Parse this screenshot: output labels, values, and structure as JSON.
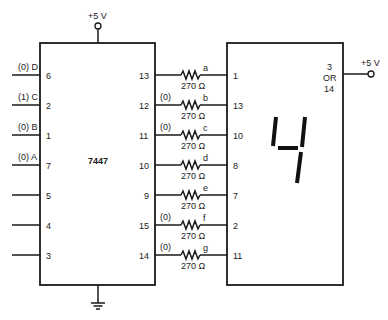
{
  "decoder": {
    "label": "7447",
    "vcc_label": "+5 V",
    "inputs": [
      {
        "name": "(0) D",
        "pin": "6"
      },
      {
        "name": "(1) C",
        "pin": "2"
      },
      {
        "name": "(0) B",
        "pin": "1"
      },
      {
        "name": "(0) A",
        "pin": "7"
      },
      {
        "name": "",
        "pin": "5"
      },
      {
        "name": "",
        "pin": "4"
      },
      {
        "name": "",
        "pin": "3"
      }
    ],
    "outputs": [
      {
        "pin": "13",
        "state": "",
        "segment": "a",
        "resistor": "270 Ω",
        "display_pin": "1"
      },
      {
        "pin": "12",
        "state": "(0)",
        "segment": "b",
        "resistor": "270 Ω",
        "display_pin": "13"
      },
      {
        "pin": "11",
        "state": "(0)",
        "segment": "c",
        "resistor": "270 Ω",
        "display_pin": "10"
      },
      {
        "pin": "10",
        "state": "",
        "segment": "d",
        "resistor": "270 Ω",
        "display_pin": "8"
      },
      {
        "pin": "9",
        "state": "",
        "segment": "e",
        "resistor": "270 Ω",
        "display_pin": "7"
      },
      {
        "pin": "15",
        "state": "(0)",
        "segment": "f",
        "resistor": "270 Ω",
        "display_pin": "2"
      },
      {
        "pin": "14",
        "state": "(0)",
        "segment": "g",
        "resistor": "270 Ω",
        "display_pin": "11"
      }
    ]
  },
  "display": {
    "anode_pin_line1": "3",
    "anode_pin_line2": "OR",
    "anode_pin_line3": "14",
    "vcc_label": "+5 V",
    "digit_shown": "4"
  }
}
